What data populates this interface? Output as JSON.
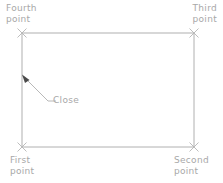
{
  "diagram": {
    "background_color": "#ffffff",
    "line_color": "#b0b0b0",
    "marker_color": "#b5b5b5",
    "text_color": "#a8a8a8",
    "arrow_color": "#4a4a4a",
    "labels": {
      "fourth_point": {
        "line1": "Fourth",
        "line2": "point"
      },
      "third_point": {
        "line1": "Third",
        "line2": "point"
      },
      "first_point": {
        "line1": "First",
        "line2": "point"
      },
      "second_point": {
        "line1": "Second",
        "line2": "point"
      },
      "close": "Close"
    },
    "rectangle": {
      "left": 22,
      "top": 33,
      "right": 194,
      "bottom": 147
    },
    "corner_markers": [
      {
        "name": "fourth-point-marker",
        "x": 22,
        "y": 33
      },
      {
        "name": "third-point-marker",
        "x": 194,
        "y": 33
      },
      {
        "name": "first-point-marker",
        "x": 22,
        "y": 147
      },
      {
        "name": "second-point-marker",
        "x": 194,
        "y": 147
      }
    ],
    "leader": {
      "arrow_tip_x": 22,
      "arrow_tip_y": 75,
      "vertex_x": 48,
      "vertex_y": 101,
      "end_x": 56,
      "end_y": 101
    }
  }
}
